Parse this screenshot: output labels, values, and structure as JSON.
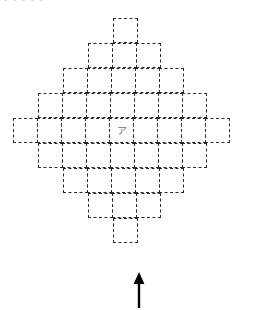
{
  "figure": {
    "name": "dashed-diamond-cell-grid",
    "top_caption": "ⅰ ⅰ ⅰ ⅰ ⅰ",
    "center_cell_label": "ァ",
    "cell_size_px": 25,
    "grid_origin_px": {
      "x": 14,
      "y": 18
    },
    "line_color": "#2a2a2a",
    "line_style": "dashed",
    "background_color": "#ffffff",
    "center_label_color": "#8c8c8c",
    "arrow": {
      "name": "up-arrow",
      "direction": "up",
      "color": "#000000",
      "x_px": 139,
      "y_top_px": 272,
      "y_bottom_px": 308
    },
    "rows": [
      {
        "index": 1,
        "cells": 1,
        "offset_cells": 4
      },
      {
        "index": 2,
        "cells": 3,
        "offset_cells": 3
      },
      {
        "index": 3,
        "cells": 5,
        "offset_cells": 2
      },
      {
        "index": 4,
        "cells": 7,
        "offset_cells": 1
      },
      {
        "index": 5,
        "cells": 9,
        "offset_cells": 0
      },
      {
        "index": 6,
        "cells": 7,
        "offset_cells": 1
      },
      {
        "index": 7,
        "cells": 5,
        "offset_cells": 2
      },
      {
        "index": 8,
        "cells": 3,
        "offset_cells": 3
      },
      {
        "index": 9,
        "cells": 1,
        "offset_cells": 4
      }
    ],
    "total_cells": 41,
    "center_row_index": 5,
    "center_column_index": 5
  },
  "chart_data": {
    "type": "heatmap",
    "title": "",
    "xlabel": "",
    "ylabel": "",
    "grid": true,
    "legend": "none",
    "categories": [
      "row 1",
      "row 2",
      "row 3",
      "row 4",
      "row 5",
      "row 6",
      "row 7",
      "row 8",
      "row 9"
    ],
    "values": [
      1,
      3,
      5,
      7,
      9,
      7,
      5,
      3,
      1
    ],
    "ylim": [
      0,
      9
    ],
    "annotations": [
      {
        "text": "ァ",
        "target": "center cell (row 5, column 5)"
      },
      {
        "text": "up-arrow",
        "target": "below bottom apex cell (row 9)"
      }
    ]
  }
}
